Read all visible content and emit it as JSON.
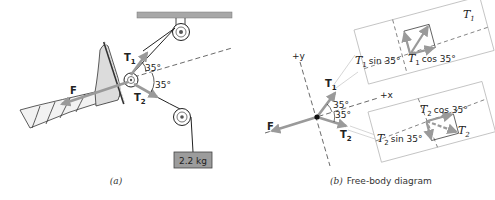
{
  "figure_a": {
    "caption": "(a)",
    "force_F": "F",
    "tension_T1": "T",
    "tension_T1_sub": "1",
    "tension_T2": "T",
    "tension_T2_sub": "2",
    "angle_upper": "35°",
    "angle_lower": "35°",
    "mass_label": "2.2 kg"
  },
  "figure_b": {
    "caption_prefix": "(b)",
    "caption_text": "Free-body diagram",
    "axis_y": "+y",
    "axis_x": "+x",
    "force_F": "F",
    "tension_T1": "T",
    "tension_T1_sub": "1",
    "tension_T2": "T",
    "tension_T2_sub": "2",
    "angle_upper": "35°",
    "angle_lower": "35°",
    "inset_upper": {
      "vector": "T",
      "vector_sub": "1",
      "vertical_component": "sin 35°",
      "horizontal_component": "cos 35°"
    },
    "inset_lower": {
      "vector": "T",
      "vector_sub": "2",
      "vertical_component": "sin 35°",
      "horizontal_component": "cos 35°"
    }
  },
  "colors": {
    "arrow": "#9a9a9a",
    "ceiling": "#a8a8a8",
    "mass_fill": "#9c9c9c",
    "line": "#222222"
  }
}
